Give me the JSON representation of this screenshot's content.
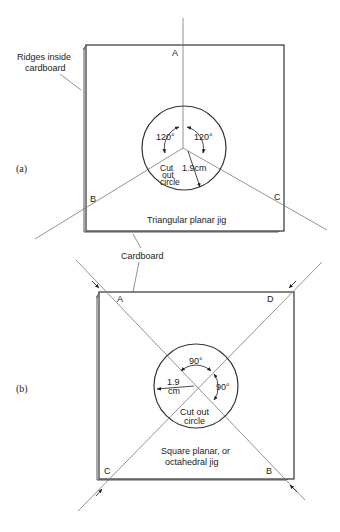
{
  "colors": {
    "line": "#333333",
    "thin_line": "#777777",
    "background": "#ffffff"
  },
  "panel_a": {
    "label": "(a)",
    "title": "Triangular planar jig",
    "callouts": {
      "ridges_line1": "Ridges inside",
      "ridges_line2": "cardboard",
      "cardboard": "Cardboard"
    },
    "points": {
      "a": "A",
      "b": "B",
      "c": "C"
    },
    "angle_left": "120°",
    "angle_right": "120°",
    "radius": "1.9cm",
    "circle_line1": "Cut",
    "circle_line2": "out",
    "circle_line3": "circle"
  },
  "panel_b": {
    "label": "(b)",
    "title_line1": "Square planar, or",
    "title_line2": "octahedral jig",
    "points": {
      "a": "A",
      "b": "B",
      "c": "C",
      "d": "D"
    },
    "angle_top": "90°",
    "angle_right": "90°",
    "radius_line1": "1.9",
    "radius_line2": "cm",
    "circle_line1": "Cut out",
    "circle_line2": "circle"
  }
}
